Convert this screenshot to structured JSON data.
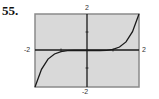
{
  "problem": {
    "number": "55."
  },
  "colors": {
    "plot_bg": "#d9d9d9",
    "frame": "#8a8a8a",
    "axis": "#1a1a1a",
    "curve": "#1a1a1a"
  },
  "chart_data": {
    "type": "line",
    "title": "",
    "xlabel": "",
    "ylabel": "",
    "xlim": [
      -2,
      2
    ],
    "ylim": [
      -2,
      2
    ],
    "grid": false,
    "tick_labels": {
      "x_min": "-2",
      "x_max": "2",
      "y_min": "-2",
      "y_max": "2"
    },
    "ticks": {
      "x": [
        -1,
        1
      ],
      "y": [
        -1,
        1
      ]
    },
    "series": [
      {
        "name": "f(x)",
        "description": "odd, increasing curve, nearly flat on x-axis near origin",
        "x": [
          -2,
          -1.75,
          -1.5,
          -1.25,
          -1,
          -0.75,
          -0.5,
          0,
          0.5,
          0.75,
          1,
          1.25,
          1.5,
          1.75,
          2
        ],
        "y": [
          -2,
          -1.03,
          -0.47,
          -0.19,
          -0.06,
          -0.01,
          0,
          0,
          0,
          0.01,
          0.06,
          0.19,
          0.47,
          1.03,
          2
        ]
      }
    ]
  }
}
